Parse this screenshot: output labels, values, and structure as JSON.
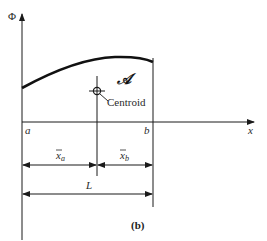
{
  "figure": {
    "caption": "(b)",
    "y_axis_label": "Φ",
    "x_axis_label": "x",
    "area_label": "𝒜",
    "centroid_label": "Centroid",
    "point_a_label": "a",
    "point_b_label": "b",
    "dim_xa_label": "x̄a",
    "dim_xa_main": "x",
    "dim_xa_sub": "a",
    "dim_xb_main": "x",
    "dim_xb_sub": "b",
    "dim_L_label": "L",
    "stroke_color": "#1a1a1a",
    "background_color": "#ffffff"
  }
}
